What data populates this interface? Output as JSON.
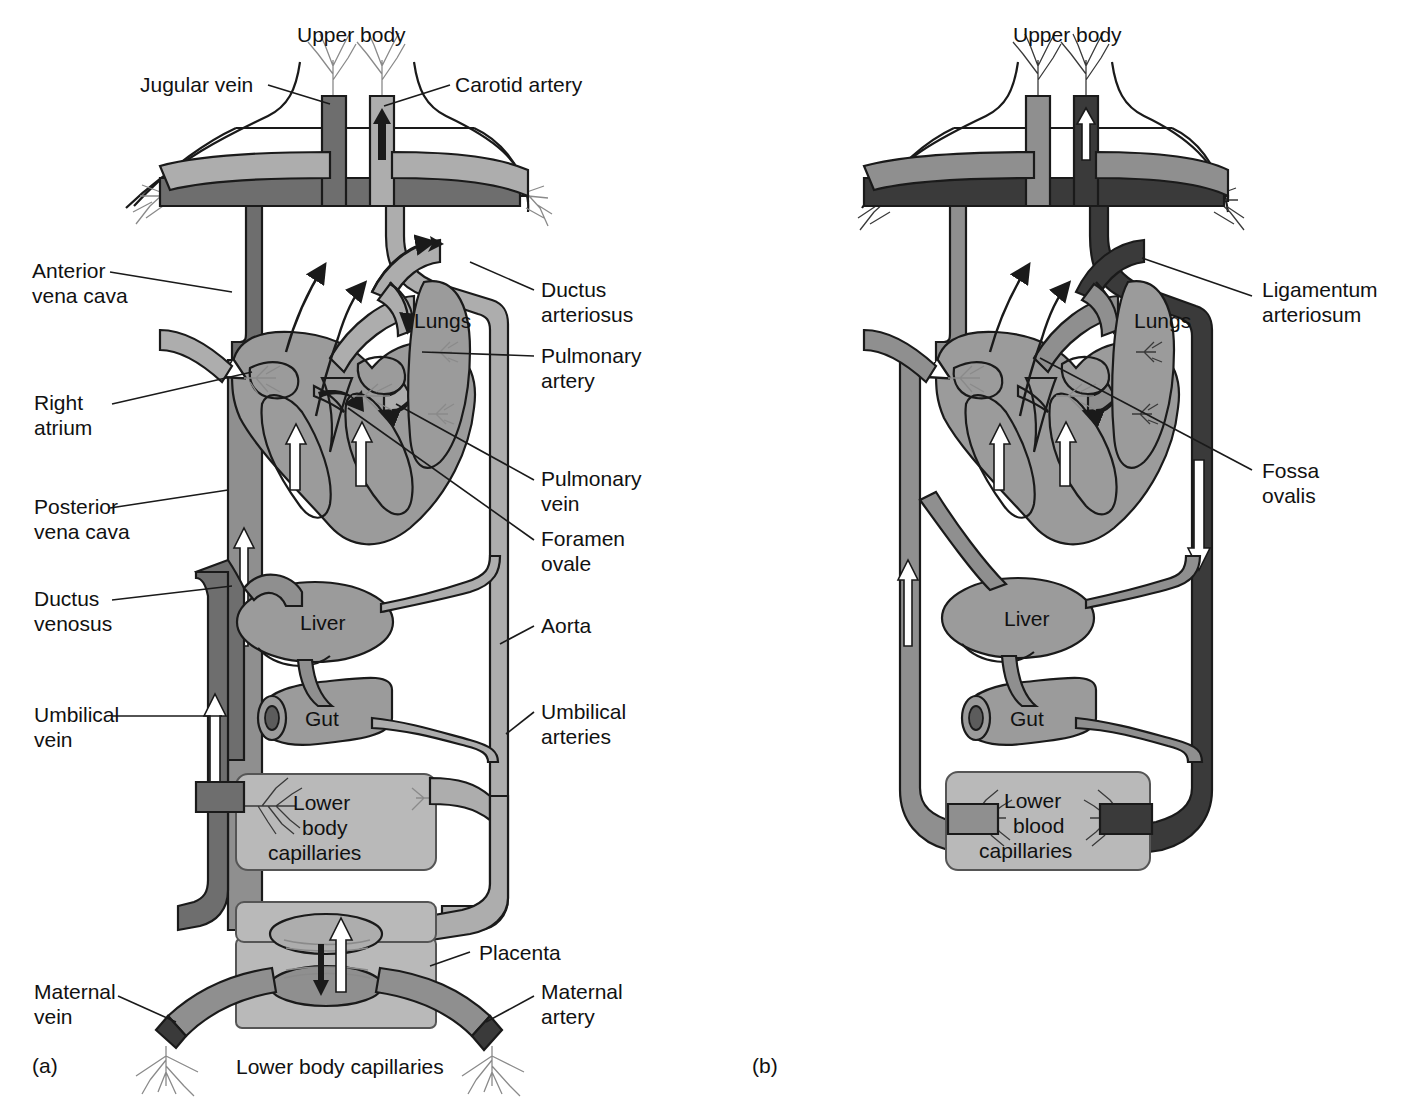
{
  "figure": {
    "panels": [
      {
        "id": "a",
        "id_label": "(a)",
        "caption_bottom": "Lower body capillaries",
        "top_label": "Upper body",
        "organ_labels": [
          "Lungs",
          "Liver",
          "Gut"
        ],
        "capillary_box_label": "Lower\nbody\ncapillaries",
        "capillary_box_lines": [
          "Lower",
          "body",
          "capillaries"
        ],
        "labels_left": [
          {
            "key": "jugular-vein",
            "text": "Jugular vein"
          },
          {
            "key": "anterior-vena-cava",
            "lines": [
              "Anterior",
              "vena cava"
            ]
          },
          {
            "key": "right-atrium",
            "lines": [
              "Right",
              "atrium"
            ]
          },
          {
            "key": "posterior-vena-cava",
            "lines": [
              "Posterior",
              "vena cava"
            ]
          },
          {
            "key": "ductus-venosus",
            "lines": [
              "Ductus",
              "venosus"
            ]
          },
          {
            "key": "umbilical-vein",
            "lines": [
              "Umbilical",
              "vein"
            ]
          },
          {
            "key": "maternal-vein",
            "lines": [
              "Maternal",
              "vein"
            ]
          }
        ],
        "labels_right": [
          {
            "key": "carotid-artery",
            "text": "Carotid artery"
          },
          {
            "key": "ductus-arteriosus",
            "lines": [
              "Ductus",
              "arteriosus"
            ]
          },
          {
            "key": "pulmonary-artery",
            "lines": [
              "Pulmonary",
              "artery"
            ]
          },
          {
            "key": "pulmonary-vein",
            "lines": [
              "Pulmonary",
              "vein"
            ]
          },
          {
            "key": "foramen-ovale",
            "lines": [
              "Foramen",
              "ovale"
            ]
          },
          {
            "key": "aorta",
            "text": "Aorta"
          },
          {
            "key": "umbilical-arteries",
            "lines": [
              "Umbilical",
              "arteries"
            ]
          },
          {
            "key": "placenta",
            "text": "Placenta"
          },
          {
            "key": "maternal-artery",
            "lines": [
              "Maternal",
              "artery"
            ]
          }
        ]
      },
      {
        "id": "b",
        "id_label": "(b)",
        "top_label": "Upper body",
        "organ_labels": [
          "Lungs",
          "Liver",
          "Gut"
        ],
        "capillary_box_lines": [
          "Lower",
          "blood",
          "capillaries"
        ],
        "labels_right": [
          {
            "key": "ligamentum-arteriosum",
            "lines": [
              "Ligamentum",
              "arteriosum"
            ]
          },
          {
            "key": "fossa-ovalis",
            "lines": [
              "Fossa",
              "ovalis"
            ]
          }
        ]
      }
    ]
  },
  "text": {
    "upper_body": "Upper body",
    "jugular_vein": "Jugular vein",
    "carotid_artery": "Carotid artery",
    "anterior_1": "Anterior",
    "anterior_2": "vena cava",
    "ductus_art_1": "Ductus",
    "ductus_art_2": "arteriosus",
    "lungs": "Lungs",
    "pulm_art_1": "Pulmonary",
    "pulm_art_2": "artery",
    "right_1": "Right",
    "right_2": "atrium",
    "pulm_vein_1": "Pulmonary",
    "pulm_vein_2": "vein",
    "foramen_1": "Foramen",
    "foramen_2": "ovale",
    "post_vc_1": "Posterior",
    "post_vc_2": "vena cava",
    "ductus_ven_1": "Ductus",
    "ductus_ven_2": "venosus",
    "liver": "Liver",
    "aorta": "Aorta",
    "umb_vein_1": "Umbilical",
    "umb_vein_2": "vein",
    "gut": "Gut",
    "umb_art_1": "Umbilical",
    "umb_art_2": "arteries",
    "cap_1": "Lower",
    "cap_2": "body",
    "cap_3": "capillaries",
    "placenta": "Placenta",
    "maternal_vein_1": "Maternal",
    "maternal_vein_2": "vein",
    "maternal_art_1": "Maternal",
    "maternal_art_2": "artery",
    "panel_a": "(a)",
    "lower_body_capillaries": "Lower body capillaries",
    "upper_body_b": "Upper body",
    "ligament_1": "Ligamentum",
    "ligament_2": "arteriosum",
    "lungs_b": "Lungs",
    "fossa_1": "Fossa",
    "fossa_2": "ovalis",
    "liver_b": "Liver",
    "gut_b": "Gut",
    "capb_1": "Lower",
    "capb_2": "blood",
    "capb_3": "capillaries",
    "panel_b": "(b)"
  },
  "colors": {
    "vein_dark": "#6e6e6e",
    "artery_light": "#adadad",
    "mixed_mid": "#8f8f8f",
    "very_dark": "#3a3a3a",
    "organ_fill": "#9b9b9b",
    "box_fill": "#b9b9b9",
    "outline": "#1a1a1a",
    "white": "#ffffff",
    "text": "#111111"
  }
}
